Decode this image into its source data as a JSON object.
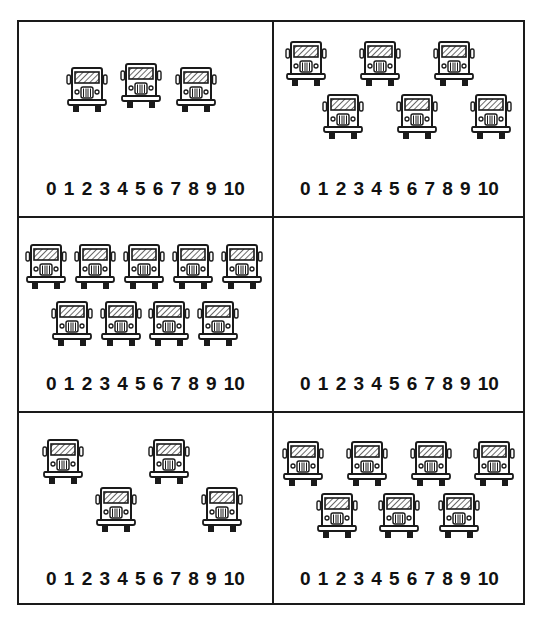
{
  "worksheet": {
    "number_line": [
      "0",
      "1",
      "2",
      "3",
      "4",
      "5",
      "6",
      "7",
      "8",
      "9",
      "10"
    ],
    "panels": [
      {
        "id": "top-left",
        "truck_count": 3,
        "trucks": [
          {
            "x": 66,
            "y": 66
          },
          {
            "x": 120,
            "y": 62
          },
          {
            "x": 175,
            "y": 66
          }
        ]
      },
      {
        "id": "top-right",
        "truck_count": 6,
        "trucks": [
          {
            "x": 285,
            "y": 40
          },
          {
            "x": 359,
            "y": 40
          },
          {
            "x": 433,
            "y": 40
          },
          {
            "x": 322,
            "y": 93
          },
          {
            "x": 396,
            "y": 93
          },
          {
            "x": 470,
            "y": 93
          }
        ]
      },
      {
        "id": "middle-left",
        "truck_count": 9,
        "trucks": [
          {
            "x": 25,
            "y": 243
          },
          {
            "x": 74,
            "y": 243
          },
          {
            "x": 123,
            "y": 243
          },
          {
            "x": 172,
            "y": 243
          },
          {
            "x": 221,
            "y": 243
          },
          {
            "x": 51,
            "y": 300
          },
          {
            "x": 100,
            "y": 300
          },
          {
            "x": 148,
            "y": 300
          },
          {
            "x": 197,
            "y": 300
          }
        ]
      },
      {
        "id": "middle-right",
        "truck_count": 0,
        "trucks": []
      },
      {
        "id": "bottom-left",
        "truck_count": 4,
        "trucks": [
          {
            "x": 42,
            "y": 438
          },
          {
            "x": 148,
            "y": 438
          },
          {
            "x": 95,
            "y": 486
          },
          {
            "x": 201,
            "y": 486
          }
        ]
      },
      {
        "id": "bottom-right",
        "truck_count": 7,
        "trucks": [
          {
            "x": 282,
            "y": 440
          },
          {
            "x": 346,
            "y": 440
          },
          {
            "x": 410,
            "y": 440
          },
          {
            "x": 473,
            "y": 440
          },
          {
            "x": 316,
            "y": 492
          },
          {
            "x": 378,
            "y": 492
          },
          {
            "x": 438,
            "y": 492
          }
        ]
      }
    ],
    "colors": {
      "ink": "#1a1a1a",
      "paper": "#ffffff"
    }
  }
}
